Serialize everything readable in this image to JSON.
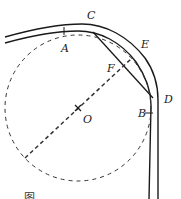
{
  "diagram": {
    "type": "geometry-road-curve",
    "labels": {
      "C": "C",
      "A": "A",
      "E": "E",
      "F": "F",
      "B": "B",
      "D": "D",
      "O": "O"
    },
    "caption": "图",
    "colors": {
      "stroke": "#1a1a1a",
      "dashed": "#333333",
      "background": "#ffffff"
    },
    "circle": {
      "cx": 78,
      "cy": 108,
      "r": 73
    }
  }
}
